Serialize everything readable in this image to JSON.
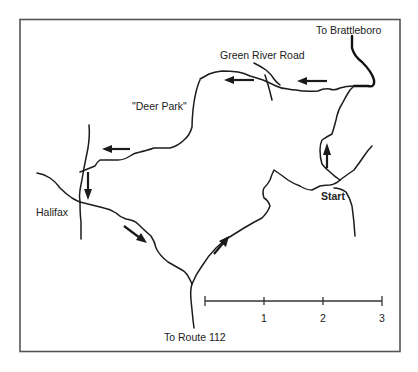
{
  "map": {
    "labels": {
      "to_brattleboro": "To Brattleboro",
      "green_river_road": "Green River Road",
      "deer_park": "\"Deer Park\"",
      "halifax": "Halifax",
      "start": "Start",
      "to_route_112": "To Route 112"
    },
    "route_arrows": [
      {
        "location": "green-river-road-east",
        "direction": "west"
      },
      {
        "location": "green-river-road-west",
        "direction": "west"
      },
      {
        "location": "deer-park-road",
        "direction": "west"
      },
      {
        "location": "halifax-north",
        "direction": "south"
      },
      {
        "location": "halifax-southeast",
        "direction": "southeast"
      },
      {
        "location": "route-112-junction",
        "direction": "northeast"
      },
      {
        "location": "start-north",
        "direction": "north"
      }
    ],
    "scale": {
      "ticks": [
        "",
        "1",
        "2",
        "3"
      ],
      "unit_count": 3
    },
    "colors": {
      "ink": "#1c1c1c",
      "frame": "#555555",
      "background": "#ffffff"
    }
  }
}
